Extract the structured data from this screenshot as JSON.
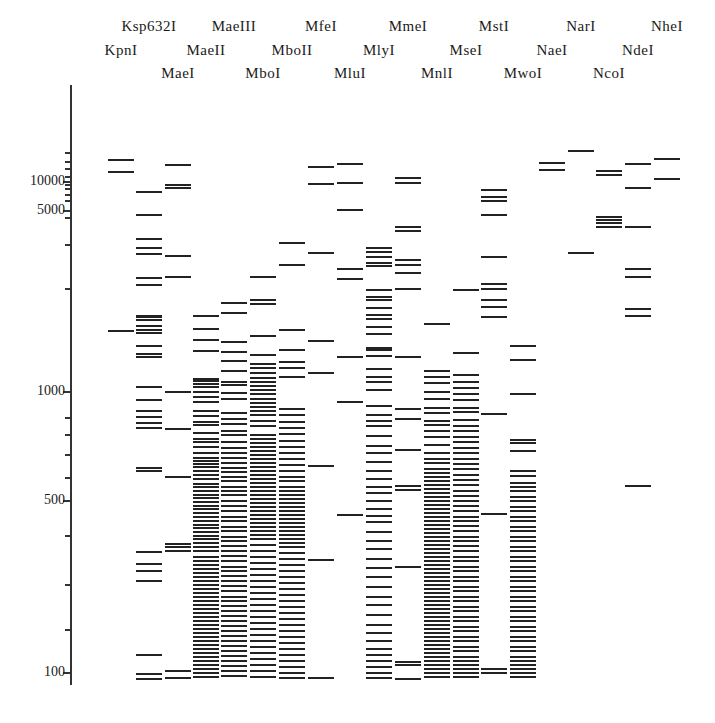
{
  "chart_data": {
    "type": "table",
    "title": "",
    "ylabel": "",
    "xlabel": "",
    "y_scale": "log",
    "ylim": [
      95,
      20000
    ],
    "y_ticks": [
      {
        "label": "10000",
        "value": 10000,
        "y": 181
      },
      {
        "label": "5000",
        "value": 5000,
        "y": 210
      },
      {
        "label": "1000",
        "value": 1000,
        "y": 391
      },
      {
        "label": "500",
        "value": 500,
        "y": 500
      },
      {
        "label": "100",
        "value": 100,
        "y": 672
      }
    ],
    "minor_ticks_y": [
      152,
      161,
      168,
      176,
      184,
      188,
      194,
      200,
      217,
      244,
      288,
      417,
      434,
      454,
      477,
      535,
      584,
      629
    ],
    "grid": false,
    "legend": null,
    "categories": [
      "KpnI",
      "Ksp632I",
      "MaeI",
      "MaeII",
      "MaeIII",
      "MboI",
      "MboII",
      "MfeI",
      "MluI",
      "MlyI",
      "MmeI",
      "MnlI",
      "MseI",
      "MstI",
      "MwoI",
      "NaeI",
      "NarI",
      "NcoI",
      "NdeI",
      "NheI"
    ],
    "series": [
      {
        "name": "KpnI",
        "x": 121,
        "label_row": 2,
        "band_y": [
          159,
          171,
          330
        ]
      },
      {
        "name": "Ksp632I",
        "x": 149,
        "label_row": 1,
        "band_y": [
          191,
          214,
          238,
          247,
          253,
          277,
          284,
          315,
          316,
          319,
          325,
          329,
          332,
          345,
          353,
          356,
          386,
          399,
          410,
          416,
          422,
          427,
          467,
          470,
          551,
          563,
          570,
          580,
          654,
          673,
          678
        ]
      },
      {
        "name": "MaeI",
        "x": 178,
        "label_row": 3,
        "band_y": [
          164,
          184,
          187,
          255,
          276,
          391,
          428,
          476,
          543,
          546,
          550,
          670,
          677
        ]
      },
      {
        "name": "MaeII",
        "x": 206,
        "label_row": 2,
        "band_y": [
          315,
          328,
          339,
          350,
          378,
          380,
          383,
          386,
          391,
          396,
          401,
          410,
          415,
          421,
          424,
          432,
          438,
          441,
          446,
          452,
          457,
          460,
          463,
          466,
          470,
          474,
          478,
          483,
          486,
          490,
          494,
          497,
          501,
          505,
          508,
          512,
          516,
          520,
          524,
          527,
          531,
          535,
          538,
          542,
          546,
          550,
          556,
          560,
          564,
          568,
          572,
          576,
          580,
          584,
          588,
          592,
          596,
          600,
          604,
          608,
          612,
          616,
          620,
          624,
          628,
          632,
          636,
          640,
          644,
          648,
          652,
          656,
          660,
          664,
          668,
          672,
          676
        ]
      },
      {
        "name": "MaeIII",
        "x": 234,
        "label_row": 1,
        "band_y": [
          302,
          312,
          341,
          351,
          360,
          370,
          381,
          384,
          392,
          398,
          412,
          418,
          423,
          430,
          434,
          441,
          447,
          452,
          457,
          462,
          467,
          471,
          476,
          480,
          486,
          490,
          494,
          500,
          505,
          510,
          516,
          520,
          526,
          530,
          536,
          540,
          545,
          550,
          555,
          560,
          566,
          570,
          575,
          580,
          585,
          590,
          596,
          600,
          605,
          610,
          615,
          620,
          625,
          630,
          635,
          640,
          645,
          650,
          655,
          660,
          665,
          670,
          675
        ]
      },
      {
        "name": "MboI",
        "x": 263,
        "label_row": 3,
        "band_y": [
          276,
          299,
          303,
          335,
          354,
          363,
          367,
          372,
          377,
          381,
          385,
          389,
          393,
          398,
          402,
          406,
          410,
          414,
          420,
          425,
          434,
          438,
          442,
          446,
          450,
          454,
          458,
          462,
          466,
          470,
          474,
          478,
          482,
          486,
          490,
          494,
          498,
          502,
          506,
          510,
          514,
          518,
          522,
          526,
          530,
          534,
          538,
          544,
          550,
          556,
          562,
          568,
          574,
          580,
          586,
          592,
          598,
          604,
          610,
          616,
          622,
          628,
          634,
          640,
          646,
          652,
          658,
          664,
          670,
          676
        ]
      },
      {
        "name": "MboII",
        "x": 292,
        "label_row": 2,
        "band_y": [
          242,
          264,
          329,
          349,
          361,
          367,
          376,
          408,
          414,
          421,
          427,
          433,
          440,
          446,
          452,
          458,
          464,
          470,
          476,
          480,
          486,
          490,
          494,
          498,
          502,
          506,
          510,
          514,
          518,
          522,
          526,
          530,
          534,
          538,
          542,
          546,
          552,
          558,
          564,
          570,
          576,
          582,
          588,
          594,
          600,
          606,
          612,
          618,
          624,
          630,
          636,
          642,
          648,
          654,
          660,
          666,
          672,
          677
        ]
      },
      {
        "name": "MfeI",
        "x": 321,
        "label_row": 1,
        "band_y": [
          166,
          183,
          252,
          340,
          372,
          465,
          559,
          677
        ]
      },
      {
        "name": "MluI",
        "x": 350,
        "label_row": 3,
        "band_y": [
          163,
          182,
          209,
          268,
          278,
          356,
          401,
          514
        ]
      },
      {
        "name": "MlyI",
        "x": 379,
        "label_row": 2,
        "band_y": [
          247,
          251,
          256,
          262,
          265,
          289,
          296,
          299,
          307,
          314,
          318,
          326,
          333,
          347,
          349,
          355,
          368,
          376,
          381,
          389,
          405,
          414,
          420,
          425,
          435,
          445,
          452,
          461,
          470,
          478,
          486,
          492,
          500,
          508,
          515,
          521,
          531,
          540,
          548,
          558,
          567,
          576,
          586,
          596,
          604,
          614,
          624,
          632,
          640,
          648,
          654,
          660,
          666,
          672,
          677
        ]
      },
      {
        "name": "MmeI",
        "x": 408,
        "label_row": 1,
        "band_y": [
          177,
          182,
          226,
          230,
          259,
          264,
          272,
          288,
          356,
          408,
          418,
          449,
          485,
          489,
          566,
          661,
          664,
          678
        ]
      },
      {
        "name": "MnlI",
        "x": 437,
        "label_row": 3,
        "band_y": [
          323,
          370,
          376,
          382,
          391,
          398,
          407,
          412,
          420,
          424,
          430,
          436,
          444,
          452,
          458,
          462,
          468,
          472,
          476,
          480,
          484,
          488,
          492,
          496,
          500,
          504,
          508,
          512,
          516,
          520,
          524,
          528,
          532,
          536,
          540,
          544,
          548,
          552,
          556,
          560,
          564,
          568,
          572,
          576,
          580,
          584,
          588,
          592,
          596,
          600,
          604,
          608,
          612,
          616,
          620,
          624,
          628,
          632,
          636,
          640,
          644,
          648,
          652,
          656,
          660,
          664,
          668,
          672,
          676
        ]
      },
      {
        "name": "MseI",
        "x": 466,
        "label_row": 2,
        "band_y": [
          289,
          352,
          374,
          381,
          387,
          393,
          399,
          407,
          411,
          419,
          425,
          430,
          436,
          441,
          447,
          452,
          458,
          463,
          468,
          474,
          479,
          484,
          490,
          495,
          500,
          505,
          510,
          516,
          520,
          525,
          530,
          536,
          540,
          545,
          550,
          556,
          560,
          566,
          570,
          576,
          580,
          586,
          590,
          596,
          600,
          606,
          610,
          616,
          620,
          626,
          630,
          636,
          640,
          646,
          650,
          656,
          660,
          664,
          668,
          672,
          676
        ]
      },
      {
        "name": "MstI",
        "x": 494,
        "label_row": 1,
        "band_y": [
          189,
          196,
          200,
          214,
          256,
          283,
          288,
          299,
          306,
          316,
          413,
          513,
          668,
          672
        ]
      },
      {
        "name": "MwoI",
        "x": 523,
        "label_row": 3,
        "band_y": [
          345,
          359,
          393,
          439,
          442,
          450,
          470,
          475,
          482,
          486,
          490,
          496,
          500,
          506,
          510,
          516,
          520,
          526,
          530,
          536,
          540,
          546,
          550,
          556,
          560,
          566,
          570,
          576,
          580,
          586,
          590,
          596,
          600,
          606,
          610,
          616,
          620,
          626,
          630,
          636,
          640,
          646,
          650,
          656,
          660,
          664,
          668,
          672,
          676
        ]
      },
      {
        "name": "NaeI",
        "x": 552,
        "label_row": 2,
        "band_y": [
          162,
          169
        ]
      },
      {
        "name": "NarI",
        "x": 581,
        "label_row": 1,
        "band_y": [
          150,
          252
        ]
      },
      {
        "name": "NcoI",
        "x": 609,
        "label_row": 3,
        "band_y": [
          170,
          174,
          216,
          219,
          222,
          226
        ]
      },
      {
        "name": "NdeI",
        "x": 638,
        "label_row": 2,
        "band_y": [
          163,
          187,
          226,
          268,
          276,
          308,
          315,
          485
        ]
      },
      {
        "name": "NheI",
        "x": 667,
        "label_row": 1,
        "band_y": [
          158,
          178
        ]
      }
    ]
  },
  "labels": {
    "row1": [
      "Ksp632I",
      "MaeIII",
      "MfeI",
      "MmeI",
      "MstI",
      "NarI",
      "NheI"
    ],
    "row2": [
      "KpnI",
      "MaeII",
      "MboII",
      "MlyI",
      "MseI",
      "NaeI",
      "NdeI"
    ],
    "row3": [
      "MaeI",
      "MboI",
      "MluI",
      "MnlI",
      "MwoI",
      "NcoI"
    ]
  },
  "colors": {
    "band": "#222222",
    "axis": "#333333",
    "background": "#ffffff"
  }
}
